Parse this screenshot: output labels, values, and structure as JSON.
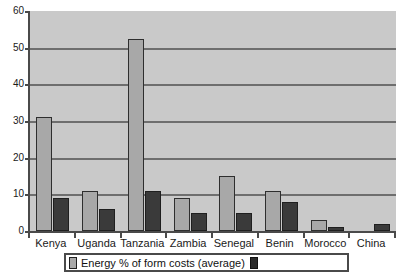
{
  "chart_data": {
    "type": "bar",
    "title": "",
    "xlabel": "",
    "ylabel": "",
    "ylim": [
      0,
      60
    ],
    "ytick_labels": [
      "60",
      "50",
      "40",
      "30",
      "20",
      "10",
      "0"
    ],
    "yticks": [
      60,
      50,
      40,
      30,
      20,
      10,
      0
    ],
    "grid": true,
    "legend_position": "bottom",
    "categories": [
      "Kenya",
      "Uganda",
      "Tanzania",
      "Zambia",
      "Senegal",
      "Benin",
      "Morocco",
      "China"
    ],
    "series": [
      {
        "name": "Energy % of form costs (average)",
        "color": "#a8a8a8",
        "values": [
          31,
          11,
          52.5,
          9,
          15,
          11,
          3,
          0
        ]
      },
      {
        "name": "",
        "color": "#3a3a3a",
        "values": [
          9,
          6,
          11,
          5,
          5,
          8,
          1,
          2
        ]
      }
    ]
  },
  "legend": {
    "entry_1_label": "Energy % of form costs (average)",
    "entry_2_label": "",
    "swatch_1_name": "light-gray-swatch",
    "swatch_2_name": "dark-gray-swatch"
  },
  "colors": {
    "plot_background": "#c9c9c9",
    "gridline": "#6e6e6e",
    "axis": "#4a4a4a",
    "series_1": "#a8a8a8",
    "series_2": "#3a3a3a",
    "page_background": "#ffffff",
    "text": "#1a1a1a"
  }
}
